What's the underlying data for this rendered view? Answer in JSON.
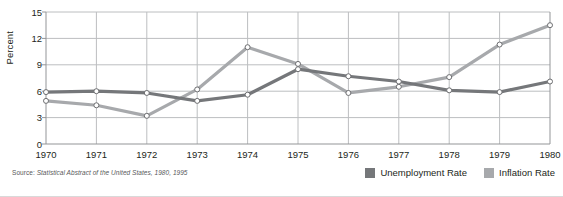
{
  "chart_data": {
    "type": "line",
    "title": "",
    "xlabel": "",
    "ylabel": "Percent",
    "categories": [
      "1970",
      "1971",
      "1972",
      "1973",
      "1974",
      "1975",
      "1976",
      "1977",
      "1978",
      "1979",
      "1980"
    ],
    "x": [
      1970,
      1971,
      1972,
      1973,
      1974,
      1975,
      1976,
      1977,
      1978,
      1979,
      1980
    ],
    "xlim": [
      1970,
      1980
    ],
    "ylim": [
      0,
      15
    ],
    "yticks": [
      0,
      3,
      6,
      9,
      12,
      15
    ],
    "ytick_labels": [
      "0",
      "3",
      "6",
      "9",
      "12",
      "15"
    ],
    "grid": true,
    "legend_position": "bottom-right",
    "series": [
      {
        "name": "Unemployment Rate",
        "color": "#75777a",
        "values": [
          5.9,
          6.0,
          5.8,
          4.9,
          5.6,
          8.5,
          7.7,
          7.1,
          6.1,
          5.9,
          7.1
        ]
      },
      {
        "name": "Inflation Rate",
        "color": "#a7a9ac",
        "values": [
          4.9,
          4.4,
          3.2,
          6.2,
          11.0,
          9.1,
          5.8,
          6.5,
          7.6,
          11.3,
          13.5
        ]
      }
    ],
    "marker": "open-circle",
    "source_note_label": "Source:",
    "source_note_title": "Statistical Abstract of the United States, 1980, 1995"
  },
  "legend": {
    "items": [
      {
        "label": "Unemployment Rate",
        "color": "#75777a"
      },
      {
        "label": "Inflation Rate",
        "color": "#a7a9ac"
      }
    ]
  },
  "axes": {
    "y_title": "Percent",
    "y_ticks": [
      "15",
      "12",
      "9",
      "6",
      "3",
      "0"
    ],
    "x_ticks": [
      "1970",
      "1971",
      "1972",
      "1973",
      "1974",
      "1975",
      "1976",
      "1977",
      "1978",
      "1979",
      "1980"
    ]
  },
  "colors": {
    "unemployment": "#75777a",
    "inflation": "#a7a9ac",
    "grid": "#bcbec0",
    "axis": "#939598",
    "text": "#231f20",
    "source_text": "#58595b"
  }
}
